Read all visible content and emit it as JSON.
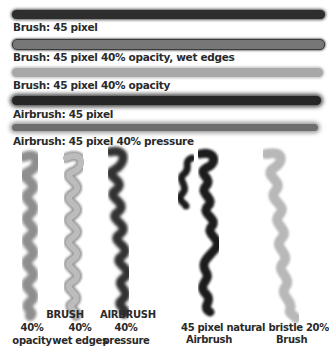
{
  "strokes": [
    {
      "label": "Brush: 45 pixel",
      "color": "#2e2e2e"
    },
    {
      "label": "Brush: 45 pixel 40% opacity, wet edges",
      "color": "#6a6a6a"
    },
    {
      "label": "Brush: 45 pixel 40% opacity",
      "color": "#a4a4a4"
    },
    {
      "label": "Airbrush: 45 pixel",
      "color": "#262626"
    },
    {
      "label": "Airbrush: 45 pixel 40% pressure",
      "color": "#6e6e6e"
    }
  ],
  "captions": {
    "brush_title": "BRUSH",
    "brush_opacity_pct": "40%",
    "brush_opacity_label": "opacity",
    "brush_wet_pct": "40%",
    "brush_wet_label": "wet edges",
    "airbrush_title": "AIRBRUSH",
    "airbrush_pct": "40%",
    "airbrush_label": "pressure",
    "natural_line1": "45 pixel natural bristle 20%",
    "natural_airbrush": "Airbrush",
    "natural_brush": "Brush"
  }
}
